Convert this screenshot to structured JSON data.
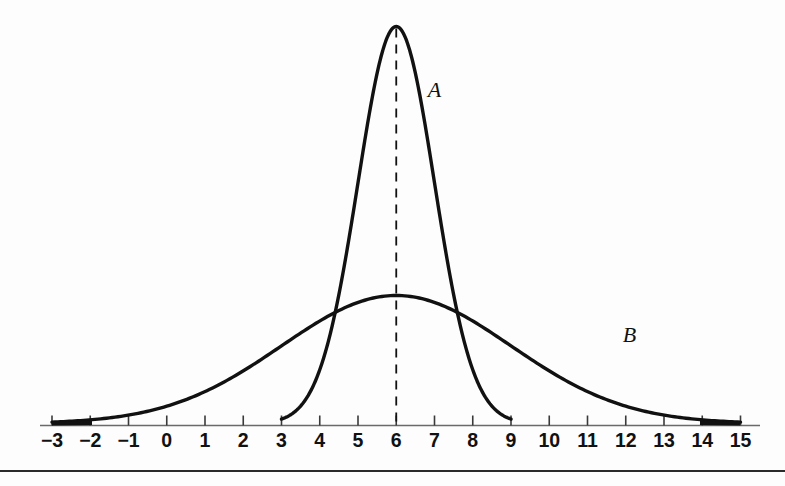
{
  "figure": {
    "title": "",
    "curve_labels": [
      {
        "name": "A",
        "text": "A",
        "x_data": 7.0,
        "y_px": 97
      },
      {
        "name": "B",
        "text": "B",
        "x_data": 12.1,
        "y_px": 342
      }
    ],
    "mean_marker": {
      "label": "",
      "x_data": 6
    },
    "axis_color": "#6a6a6a",
    "curve_color": "#111111",
    "background_color": "#fdfdfd",
    "rule_color": "#2b2b2b"
  },
  "chart_data": {
    "type": "line",
    "title": "",
    "subtitle": "",
    "xlabel": "",
    "ylabel": "",
    "xlim": [
      -3,
      15
    ],
    "ylim": [
      0,
      1
    ],
    "grid": false,
    "legend": "inline-annotations",
    "x_ticks": [
      -3,
      -2,
      -1,
      0,
      1,
      2,
      3,
      4,
      5,
      6,
      7,
      8,
      9,
      10,
      11,
      12,
      13,
      14,
      15
    ],
    "x_tick_labels": [
      "−3",
      "−2",
      "−1",
      "0",
      "1",
      "2",
      "3",
      "4",
      "5",
      "6",
      "7",
      "8",
      "9",
      "10",
      "11",
      "12",
      "13",
      "14",
      "15"
    ],
    "y_ticks": [],
    "y_tick_labels": [],
    "annotations": [
      {
        "text": "A",
        "x": 7.0,
        "note": "narrow normal curve label"
      },
      {
        "text": "B",
        "x": 12.1,
        "note": "wide normal curve label"
      },
      {
        "text": "dashed vertical line at mean",
        "x": 6
      }
    ],
    "series": [
      {
        "name": "A",
        "label": "A",
        "distribution": "normal",
        "mean": 6,
        "std": 1,
        "peak_value": 1.0,
        "visible_range": [
          3,
          9
        ],
        "x": [
          3.0,
          3.25,
          3.5,
          3.75,
          4.0,
          4.25,
          4.5,
          4.75,
          5.0,
          5.25,
          5.5,
          5.75,
          6.0,
          6.25,
          6.5,
          6.75,
          7.0,
          7.25,
          7.5,
          7.75,
          8.0,
          8.25,
          8.5,
          8.75,
          9.0
        ],
        "values": [
          0.011,
          0.022,
          0.044,
          0.079,
          0.135,
          0.216,
          0.325,
          0.458,
          0.607,
          0.757,
          0.882,
          0.966,
          1.0,
          0.966,
          0.882,
          0.757,
          0.607,
          0.458,
          0.325,
          0.216,
          0.135,
          0.079,
          0.044,
          0.022,
          0.011
        ]
      },
      {
        "name": "B",
        "label": "B",
        "distribution": "normal",
        "mean": 6,
        "std": 3,
        "peak_value": 0.333,
        "visible_range": [
          -3,
          15
        ],
        "x": [
          -3,
          -2,
          -1,
          0,
          1,
          2,
          3,
          4,
          5,
          6,
          7,
          8,
          9,
          10,
          11,
          12,
          13,
          14,
          15
        ],
        "values": [
          0.0037,
          0.0087,
          0.0189,
          0.038,
          0.0705,
          0.1205,
          0.1899,
          0.276,
          0.3696,
          0.433,
          0.3696,
          0.276,
          0.1899,
          0.1205,
          0.0705,
          0.038,
          0.0189,
          0.0087,
          0.0037
        ]
      }
    ]
  }
}
